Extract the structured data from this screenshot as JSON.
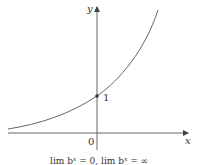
{
  "figure": {
    "type": "exponential-graph",
    "function": "y = b^x (b > 1)",
    "axes": {
      "x_label": "x",
      "y_label": "y",
      "origin_label": "0"
    },
    "point_label": "1",
    "caption": "lim b^x = 0,  lim b^x = ∞",
    "caption_parts": {
      "left": "lim b",
      "left_sup": "x",
      "left_val": " = 0,  lim b",
      "right_sup": "x",
      "right_val": " = ∞"
    },
    "colors": {
      "curve": "#555555",
      "axes": "#555555",
      "point": "#333333"
    }
  }
}
